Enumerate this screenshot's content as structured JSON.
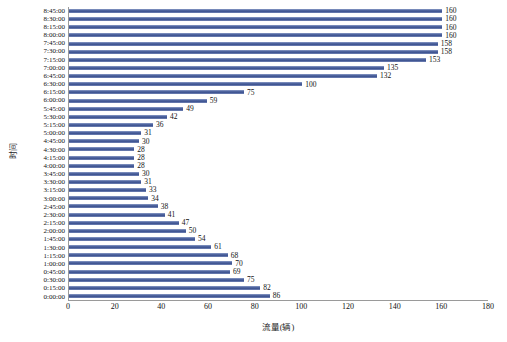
{
  "chart_data": {
    "type": "bar",
    "orientation": "horizontal",
    "title": "",
    "xlabel": "流量(辆)",
    "ylabel": "时间",
    "xlim": [
      0,
      180
    ],
    "xticks": [
      0,
      20,
      40,
      60,
      80,
      100,
      120,
      140,
      160,
      180
    ],
    "grid": false,
    "legend": null,
    "series_color": "#41568f",
    "categories": [
      "8:45:00",
      "8:30:00",
      "8:15:00",
      "8:00:00",
      "7:45:00",
      "7:30:00",
      "7:15:00",
      "7:00:00",
      "6:45:00",
      "6:30:00",
      "6:15:00",
      "6:00:00",
      "5:45:00",
      "5:30:00",
      "5:15:00",
      "5:00:00",
      "4:45:00",
      "4:30:00",
      "4:15:00",
      "4:00:00",
      "3:45:00",
      "3:30:00",
      "3:15:00",
      "3:00:00",
      "2:45:00",
      "2:30:00",
      "2:15:00",
      "2:00:00",
      "1:45:00",
      "1:30:00",
      "1:15:00",
      "1:00:00",
      "0:45:00",
      "0:30:00",
      "0:15:00",
      "0:00:00"
    ],
    "values": [
      160,
      160,
      160,
      160,
      158,
      158,
      153,
      135,
      132,
      100,
      75,
      59,
      49,
      42,
      36,
      31,
      30,
      28,
      28,
      28,
      30,
      31,
      33,
      34,
      38,
      41,
      47,
      50,
      54,
      61,
      68,
      70,
      69,
      75,
      82,
      86
    ]
  }
}
